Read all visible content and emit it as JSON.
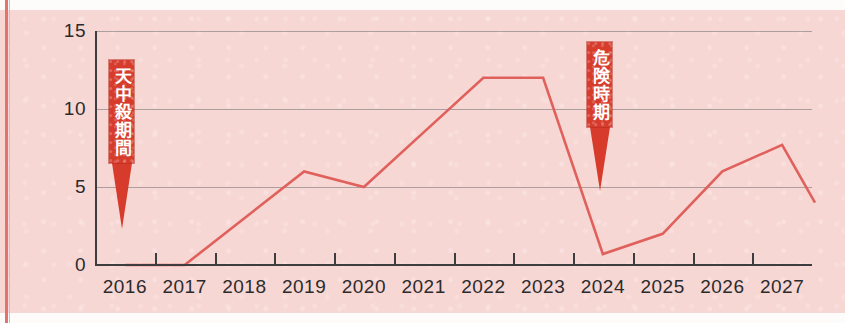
{
  "chart_data": {
    "type": "line",
    "title": "",
    "xlabel": "",
    "ylabel": "",
    "categories": [
      "2016",
      "2017",
      "2018",
      "2019",
      "2020",
      "2021",
      "2022",
      "2023",
      "2024",
      "2025",
      "2026",
      "2027"
    ],
    "values": [
      0,
      0,
      3,
      6,
      5,
      8.5,
      12,
      12,
      0.7,
      2,
      6,
      7.7
    ],
    "extra_points": [
      {
        "x": 11.55,
        "y": 4,
        "note": "line end after 2027 peak"
      }
    ],
    "ylim": [
      0,
      15
    ],
    "yticks": [
      0,
      5,
      10,
      15
    ],
    "ytick_labels": [
      "0",
      "5",
      "10",
      "15"
    ],
    "grid": true,
    "legend": "none",
    "line_color": "#e0605c",
    "background_color": "#f7d7d4",
    "axis_color": "#3d3d40",
    "annotations": [
      {
        "name": "tenchusatsu-period",
        "text": "天中殺期間",
        "color": "#d63b2b",
        "text_color": "#ffffff",
        "points_to_year": "2016"
      },
      {
        "name": "dangerous-period",
        "text": "危険時期",
        "color": "#d63b2b",
        "text_color": "#ffffff",
        "points_to_year": "2024"
      }
    ]
  }
}
